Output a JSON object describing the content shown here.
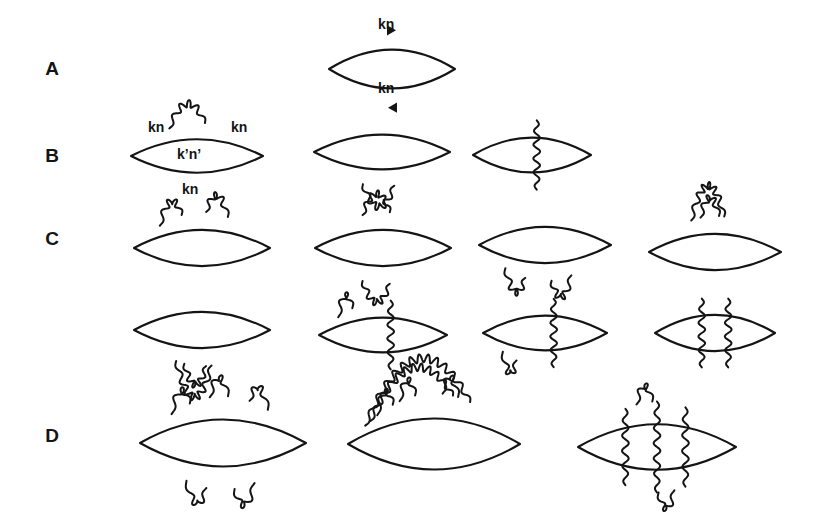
{
  "figure": {
    "background_color": "#ffffff",
    "ink_color": "#141414",
    "width": 820,
    "height": 523,
    "rows": [
      {
        "label": "A",
        "label_x": 52,
        "label_y": 75,
        "order": "lowest order bubble",
        "diagrams": [
          {
            "name": "bubble-with-momentum-labels",
            "cx": 392,
            "cy": 69,
            "rx": 63,
            "ry": 29,
            "arrows": [
              "top-right",
              "bottom-left"
            ],
            "photons": [],
            "labels": [
              {
                "text": "kn",
                "x": 378,
                "y": 29
              },
              {
                "text": "kn",
                "x": 378,
                "y": 93
              }
            ]
          }
        ]
      },
      {
        "label": "B",
        "label_x": 52,
        "label_y": 162,
        "order": "second order",
        "diagrams": [
          {
            "name": "bubble-top-photon-labeled",
            "cx": 197,
            "cy": 156,
            "rx": 66,
            "ry": 25,
            "arrows": [],
            "photons": [
              {
                "type": "arc-top",
                "start": -0.42,
                "end": 0.12,
                "height": 22,
                "amp": 3.6,
                "waves": 5
              }
            ],
            "labels": [
              {
                "text": "kn",
                "x": 148,
                "y": 132
              },
              {
                "text": "kn",
                "x": 231,
                "y": 132
              },
              {
                "text": "k’n’",
                "x": 177,
                "y": 159
              },
              {
                "text": "kn",
                "x": 182,
                "y": 194
              }
            ]
          },
          {
            "name": "bubble-bottom-photon",
            "cx": 382,
            "cy": 152,
            "rx": 68,
            "ry": 26,
            "arrows": [],
            "photons": [
              {
                "type": "arc-bottom",
                "start": -0.28,
                "end": 0.18,
                "height": 22,
                "amp": 3.6,
                "waves": 5
              }
            ],
            "labels": []
          },
          {
            "name": "bubble-vertical-photon",
            "cx": 532,
            "cy": 155,
            "rx": 59,
            "ry": 26,
            "arrows": [],
            "photons": [
              {
                "type": "vertical",
                "pos": 0.08,
                "amp": 3.4,
                "waves": 5
              }
            ],
            "labels": []
          }
        ]
      },
      {
        "label": "C",
        "label_x": 52,
        "label_y": 245,
        "order": "fourth order",
        "diagrams": [
          {
            "name": "bubble-two-top-photons",
            "cx": 202,
            "cy": 248,
            "rx": 68,
            "ry": 27,
            "arrows": [],
            "photons": [
              {
                "type": "arc-top",
                "start": -0.62,
                "end": -0.3,
                "height": 19,
                "amp": 3.4,
                "waves": 4
              },
              {
                "type": "arc-top",
                "start": 0.06,
                "end": 0.38,
                "height": 19,
                "amp": 3.4,
                "waves": 4
              }
            ],
            "labels": []
          },
          {
            "name": "bubble-top-and-bottom-photon",
            "cx": 383,
            "cy": 248,
            "rx": 68,
            "ry": 27,
            "arrows": [],
            "photons": [
              {
                "type": "arc-top",
                "start": -0.3,
                "end": 0.1,
                "height": 20,
                "amp": 3.4,
                "waves": 5
              },
              {
                "type": "arc-bottom",
                "start": -0.3,
                "end": 0.1,
                "height": 20,
                "amp": 3.4,
                "waves": 5
              }
            ],
            "labels": []
          },
          {
            "name": "bubble-two-bottom-photons",
            "cx": 545,
            "cy": 245,
            "rx": 66,
            "ry": 27,
            "arrows": [],
            "photons": [
              {
                "type": "arc-bottom",
                "start": -0.6,
                "end": -0.3,
                "height": 19,
                "amp": 3.4,
                "waves": 4
              },
              {
                "type": "arc-bottom",
                "start": 0.1,
                "end": 0.4,
                "height": 19,
                "amp": 3.4,
                "waves": 4
              }
            ],
            "labels": []
          },
          {
            "name": "bubble-nested-top-photons",
            "cx": 715,
            "cy": 252,
            "rx": 66,
            "ry": 27,
            "arrows": [],
            "photons": [
              {
                "type": "arc-top",
                "start": -0.36,
                "end": 0.14,
                "height": 33,
                "amp": 3.6,
                "waves": 7
              },
              {
                "type": "arc-top",
                "start": -0.22,
                "end": 0.06,
                "height": 19,
                "amp": 3.4,
                "waves": 4
              }
            ],
            "labels": []
          },
          {
            "name": "bubble-nested-bottom-photons",
            "cx": 202,
            "cy": 330,
            "rx": 68,
            "ry": 27,
            "arrows": [],
            "photons": [
              {
                "type": "arc-bottom",
                "start": -0.38,
                "end": 0.14,
                "height": 34,
                "amp": 3.6,
                "waves": 7
              },
              {
                "type": "arc-bottom",
                "start": -0.26,
                "end": 0.06,
                "height": 20,
                "amp": 3.4,
                "waves": 5
              }
            ],
            "labels": []
          },
          {
            "name": "bubble-top-photon-and-vertical",
            "cx": 383,
            "cy": 335,
            "rx": 64,
            "ry": 26,
            "arrows": [],
            "photons": [
              {
                "type": "arc-top",
                "start": -0.7,
                "end": -0.48,
                "height": 17,
                "amp": 3.2,
                "waves": 3
              },
              {
                "type": "vertical",
                "pos": 0.12,
                "amp": 3.4,
                "waves": 5
              }
            ],
            "labels": []
          },
          {
            "name": "bubble-bottom-photon-and-vertical",
            "cx": 545,
            "cy": 333,
            "rx": 62,
            "ry": 26,
            "arrows": [],
            "photons": [
              {
                "type": "arc-bottom",
                "start": -0.68,
                "end": -0.46,
                "height": 17,
                "amp": 3.2,
                "waves": 3
              },
              {
                "type": "vertical",
                "pos": 0.14,
                "amp": 3.4,
                "waves": 5
              }
            ],
            "labels": []
          },
          {
            "name": "bubble-two-vertical-photons",
            "cx": 715,
            "cy": 333,
            "rx": 60,
            "ry": 27,
            "arrows": [],
            "photons": [
              {
                "type": "vertical",
                "pos": -0.22,
                "amp": 3.4,
                "waves": 5
              },
              {
                "type": "vertical",
                "pos": 0.22,
                "amp": 3.4,
                "waves": 5
              }
            ],
            "labels": []
          }
        ]
      },
      {
        "label": "D",
        "label_x": 52,
        "label_y": 442,
        "order": "sixth order",
        "diagrams": [
          {
            "name": "bubble-three-top-two-bottom-photons",
            "cx": 223,
            "cy": 443,
            "rx": 83,
            "ry": 35,
            "arrows": [],
            "photons": [
              {
                "type": "arc-top",
                "start": -0.62,
                "end": -0.4,
                "height": 18,
                "amp": 3.3,
                "waves": 3
              },
              {
                "type": "arc-top",
                "start": -0.16,
                "end": 0.06,
                "height": 19,
                "amp": 3.3,
                "waves": 3
              },
              {
                "type": "arc-top",
                "start": 0.32,
                "end": 0.54,
                "height": 18,
                "amp": 3.3,
                "waves": 3
              },
              {
                "type": "arc-bottom",
                "start": -0.44,
                "end": -0.2,
                "height": 19,
                "amp": 3.3,
                "waves": 3
              },
              {
                "type": "arc-bottom",
                "start": 0.14,
                "end": 0.38,
                "height": 19,
                "amp": 3.3,
                "waves": 3
              }
            ],
            "labels": []
          },
          {
            "name": "bubble-nested-overarching-photons",
            "cx": 434,
            "cy": 444,
            "rx": 86,
            "ry": 38,
            "arrows": [],
            "photons": [
              {
                "type": "arc-top",
                "start": -0.8,
                "end": 0.42,
                "height": 55,
                "amp": 4.2,
                "waves": 13
              },
              {
                "type": "arc-top",
                "start": -0.74,
                "end": 0.22,
                "height": 40,
                "amp": 4.0,
                "waves": 11
              },
              {
                "type": "arc-top",
                "start": -0.66,
                "end": -0.48,
                "height": 18,
                "amp": 3.2,
                "waves": 3
              },
              {
                "type": "arc-top",
                "start": -0.4,
                "end": -0.22,
                "height": 18,
                "amp": 3.2,
                "waves": 3
              },
              {
                "type": "arc-top",
                "start": 0.1,
                "end": 0.28,
                "height": 18,
                "amp": 3.2,
                "waves": 3
              }
            ],
            "labels": []
          },
          {
            "name": "bubble-three-vertical-photons-plus-arcs",
            "cx": 657,
            "cy": 447,
            "rx": 79,
            "ry": 34,
            "arrows": [],
            "photons": [
              {
                "type": "vertical",
                "pos": -0.4,
                "amp": 3.4,
                "waves": 5
              },
              {
                "type": "vertical",
                "pos": 0.0,
                "amp": 3.4,
                "waves": 6
              },
              {
                "type": "vertical",
                "pos": 0.36,
                "amp": 3.4,
                "waves": 5
              },
              {
                "type": "arc-top",
                "start": -0.26,
                "end": -0.06,
                "height": 17,
                "amp": 3.2,
                "waves": 3
              },
              {
                "type": "arc-bottom",
                "start": 0.02,
                "end": 0.22,
                "height": 17,
                "amp": 3.2,
                "waves": 3
              }
            ],
            "labels": []
          }
        ]
      }
    ]
  }
}
